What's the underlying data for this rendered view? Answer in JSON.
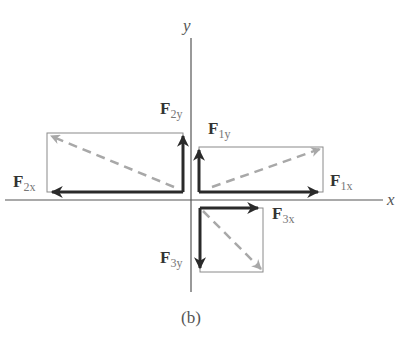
{
  "figure": {
    "caption": "(b)",
    "axes": {
      "x_label": "x",
      "y_label": "y"
    },
    "colors": {
      "component_arrow": "#2a2a2a",
      "resultant_arrow": "#a8a8a8",
      "box_line": "#8a8a8a",
      "axis_line": "#555555"
    },
    "vectors": [
      {
        "name": "F1",
        "components": [
          {
            "symbol": "F",
            "subscript": "1x",
            "direction": "right"
          },
          {
            "symbol": "F",
            "subscript": "1y",
            "direction": "up"
          }
        ]
      },
      {
        "name": "F2",
        "components": [
          {
            "symbol": "F",
            "subscript": "2x",
            "direction": "left"
          },
          {
            "symbol": "F",
            "subscript": "2y",
            "direction": "up"
          }
        ]
      },
      {
        "name": "F3",
        "components": [
          {
            "symbol": "F",
            "subscript": "3x",
            "direction": "right"
          },
          {
            "symbol": "F",
            "subscript": "3y",
            "direction": "down"
          }
        ]
      }
    ]
  }
}
